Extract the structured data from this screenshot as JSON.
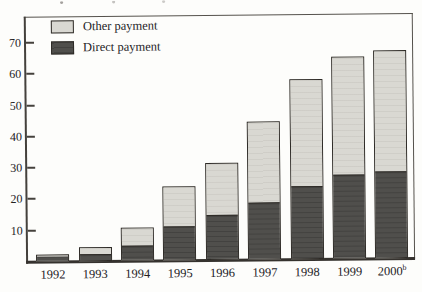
{
  "figure": {
    "legend": [
      {
        "label": "Other payment",
        "color": "#d9d8d2"
      },
      {
        "label": "Direct payment",
        "color": "#504f4c"
      }
    ]
  },
  "chart_data": {
    "type": "bar",
    "stacked": true,
    "title": "",
    "xlabel": "",
    "ylabel": "",
    "categories": [
      "1992",
      "1993",
      "1994",
      "1995",
      "1996",
      "1997",
      "1998",
      "1999",
      "2000"
    ],
    "category_superscripts": {
      "2000": "b"
    },
    "series": [
      {
        "name": "Direct payment",
        "color": "#504f4c",
        "values": [
          1.8,
          2.5,
          5,
          11,
          14.5,
          18.5,
          23.5,
          27,
          28
        ]
      },
      {
        "name": "Other payment",
        "color": "#d9d8d2",
        "values": [
          0.4,
          2,
          5.5,
          12.5,
          16.5,
          25.5,
          34,
          37.5,
          38.5
        ]
      }
    ],
    "totals": [
      2.2,
      4.5,
      10.5,
      23.5,
      31,
      44,
      57.5,
      64.5,
      66.5
    ],
    "yticks": [
      10,
      20,
      30,
      40,
      50,
      60,
      70
    ],
    "ylim": [
      0,
      78
    ],
    "grid": false,
    "legend_position": "top-left"
  }
}
